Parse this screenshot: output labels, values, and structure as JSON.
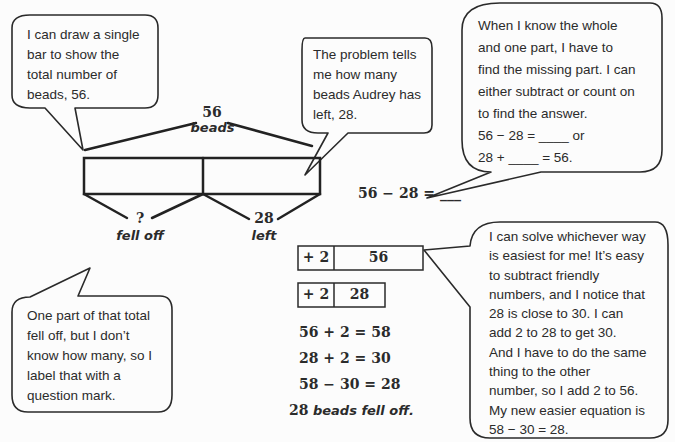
{
  "bubbles": {
    "single_bar": {
      "lines": [
        "I can draw a single",
        "bar to show the",
        "total number of",
        "beads, 56."
      ]
    },
    "audrey_left": {
      "lines": [
        "The problem tells",
        "me how many",
        "beads Audrey has",
        "left, 28."
      ]
    },
    "whole_part": {
      "lines": [
        "When I know the whole",
        "and one part, I have to",
        "find the missing part.  I can",
        "either subtract or count on",
        "to find the answer."
      ],
      "eq1": "56 − 28 = ____ or",
      "eq2": "28 + ____ = 56."
    },
    "fell_off": {
      "lines": [
        "One part of that total",
        "fell off, but I don’t",
        "know how many, so I",
        "label that with a",
        "question mark."
      ]
    },
    "easiest": {
      "lines": [
        "I can solve whichever way",
        "is easiest for me!  It’s easy",
        "to subtract friendly",
        "numbers, and I notice that",
        "28 is close to 30.  I can",
        "add 2 to 28 to get 30.",
        "And I have to do the same",
        "thing to the other",
        "number, so I add 2 to 56.",
        "My new easier equation is",
        "58 − 30 = 28."
      ]
    }
  },
  "tape_diagram": {
    "total_value": "56",
    "total_label": "beads",
    "part1_value": "?",
    "part1_label": "fell off",
    "part2_value": "28",
    "part2_label": "left"
  },
  "equation_main": "56 − 28 = ___",
  "compensation_boxes": [
    {
      "add": "+ 2",
      "value": "56"
    },
    {
      "add": "+ 2",
      "value": "28"
    }
  ],
  "work_lines": [
    "56 + 2 = 58",
    "28 + 2 = 30",
    "58 − 30 = 28"
  ],
  "answer": {
    "number": "28",
    "text": "beads fell off."
  }
}
